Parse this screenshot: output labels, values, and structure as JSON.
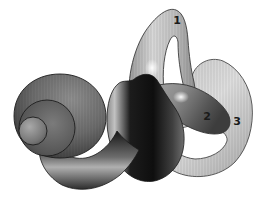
{
  "figure": {
    "labels": [
      {
        "text": "1"
      },
      {
        "text": "2"
      },
      {
        "text": "3"
      }
    ],
    "colors": {
      "background": "#ffffff",
      "outline": "#2f2f2f",
      "canal_light": "#d2d2d2",
      "canal_mid": "#8e8e8e",
      "body_dark": "#141414",
      "label_text": "#1a1a1a"
    }
  }
}
